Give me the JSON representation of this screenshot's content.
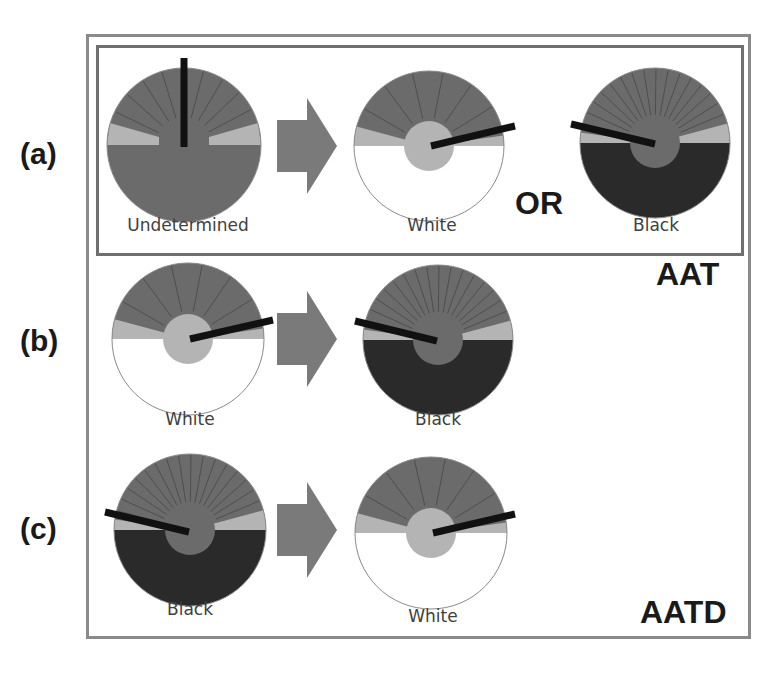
{
  "colors": {
    "dark_gray": "#6b6b6b",
    "light_gray": "#b4b4b4",
    "black_half": "#2a2a2a",
    "white_half": "#ffffff",
    "needle": "#111111",
    "arrow": "#7a7a7a",
    "spoke": "#4e4e4e",
    "outline": "#8a8a8a"
  },
  "row_labels": {
    "a": "(a)",
    "b": "(b)",
    "c": "(c)"
  },
  "or_label": "OR",
  "mode_tags": {
    "aat": "AAT",
    "aatd": "AATD"
  },
  "discs": [
    {
      "id": "a-undetermined",
      "row": "a",
      "cx": 184,
      "cy": 145,
      "r": 77,
      "state": "undetermined",
      "inner_r": 0,
      "needle": {
        "x1": 184,
        "y1": 58,
        "x2": 184,
        "y2": 147
      },
      "spokes": 9,
      "caption": "Undetermined",
      "caption_x": 188,
      "caption_y": 229
    },
    {
      "id": "a-white",
      "row": "a",
      "cx": 429,
      "cy": 146,
      "r": 75,
      "state": "white",
      "inner_r": 25,
      "needle": {
        "x1": 431,
        "y1": 146,
        "x2": 515,
        "y2": 126
      },
      "spokes": 6,
      "caption": "White",
      "caption_x": 432,
      "caption_y": 229
    },
    {
      "id": "a-black",
      "row": "a",
      "cx": 655,
      "cy": 143,
      "r": 75,
      "state": "black",
      "inner_r": 25,
      "needle": {
        "x1": 571,
        "y1": 124,
        "x2": 655,
        "y2": 144
      },
      "spokes": 16,
      "caption": "Black",
      "caption_x": 656,
      "caption_y": 229
    },
    {
      "id": "b-white",
      "row": "b",
      "cx": 188,
      "cy": 339,
      "r": 76,
      "state": "white",
      "inner_r": 25,
      "needle": {
        "x1": 190,
        "y1": 339,
        "x2": 273,
        "y2": 320
      },
      "spokes": 6,
      "caption": "White",
      "caption_x": 190,
      "caption_y": 423
    },
    {
      "id": "b-black",
      "row": "b",
      "cx": 438,
      "cy": 340,
      "r": 75,
      "state": "black",
      "inner_r": 25,
      "needle": {
        "x1": 355,
        "y1": 321,
        "x2": 437,
        "y2": 341
      },
      "spokes": 16,
      "caption": "Black",
      "caption_x": 438,
      "caption_y": 423
    },
    {
      "id": "c-black",
      "row": "c",
      "cx": 190,
      "cy": 530,
      "r": 76,
      "state": "black",
      "inner_r": 25,
      "needle": {
        "x1": 105,
        "y1": 512,
        "x2": 189,
        "y2": 532
      },
      "spokes": 16,
      "caption": "Black",
      "caption_x": 190,
      "caption_y": 613
    },
    {
      "id": "c-white",
      "row": "c",
      "cx": 431,
      "cy": 533,
      "r": 76,
      "state": "white",
      "inner_r": 25,
      "needle": {
        "x1": 433,
        "y1": 533,
        "x2": 515,
        "y2": 514
      },
      "spokes": 6,
      "caption": "White",
      "caption_x": 433,
      "caption_y": 620
    }
  ],
  "arrows": [
    {
      "id": "arrow-a",
      "x": 277,
      "cy": 146
    },
    {
      "id": "arrow-b",
      "x": 277,
      "cy": 339
    },
    {
      "id": "arrow-c",
      "x": 277,
      "cy": 530
    }
  ]
}
